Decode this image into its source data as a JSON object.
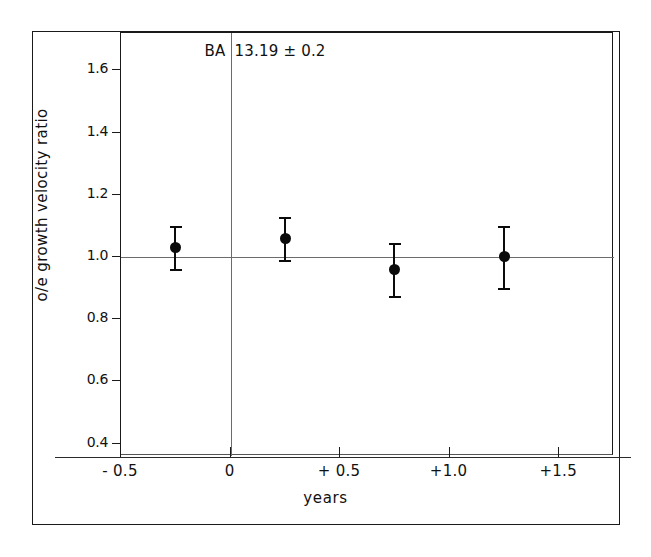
{
  "chart_data": {
    "type": "scatter",
    "title": "",
    "xlabel": "years",
    "ylabel": "o/e growth velocity ratio",
    "xlim": [
      -0.5,
      1.75
    ],
    "ylim": [
      0.36,
      1.72
    ],
    "grid": false,
    "legend": false,
    "x_ticks": [
      {
        "value": -0.5,
        "label": "- 0.5"
      },
      {
        "value": 0.0,
        "label": "0"
      },
      {
        "value": 0.5,
        "label": "+ 0.5"
      },
      {
        "value": 1.0,
        "label": "+1.0"
      },
      {
        "value": 1.5,
        "label": "+1.5"
      }
    ],
    "y_ticks": [
      {
        "value": 1.6,
        "label": "1.6"
      },
      {
        "value": 1.4,
        "label": "1.4"
      },
      {
        "value": 1.2,
        "label": "1.2"
      },
      {
        "value": 1.0,
        "label": "1.0"
      },
      {
        "value": 0.8,
        "label": "0.8"
      },
      {
        "value": 0.6,
        "label": "0.6"
      },
      {
        "value": 0.4,
        "label": "0.4"
      }
    ],
    "reference_line": {
      "orientation": "horizontal",
      "value": 1.0,
      "color": "#6b6b6b"
    },
    "marker_line": {
      "orientation": "vertical",
      "value": 0.0,
      "color": "#6b6b6b"
    },
    "annotation": {
      "label": "BA",
      "value": "13.19 ± 0.2",
      "x": 0.0
    },
    "series": [
      {
        "name": "o/e growth velocity ratio",
        "marker": "filled-circle",
        "color": "#0b0b0b",
        "points": [
          {
            "x": -0.25,
            "y": 1.03,
            "err": 0.07
          },
          {
            "x": 0.25,
            "y": 1.06,
            "err": 0.07
          },
          {
            "x": 0.75,
            "y": 0.96,
            "err": 0.085
          },
          {
            "x": 1.25,
            "y": 1.0,
            "err": 0.1
          }
        ]
      }
    ]
  }
}
